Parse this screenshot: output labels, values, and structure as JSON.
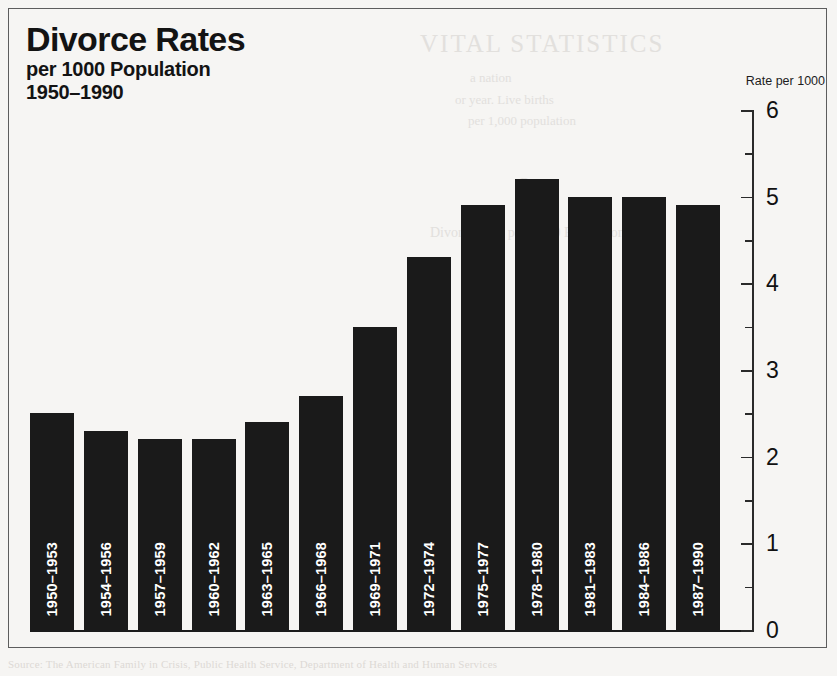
{
  "title": "Divorce Rates",
  "subtitle": "per 1000 Population",
  "period": "1950–1990",
  "axis_caption": "Rate per 1000",
  "bleed_through": {
    "note": "faint show-through text from the reverse side of the printed page",
    "line_title": "VITAL STATISTICS",
    "line1": "a nation",
    "line2": "or year. Live births",
    "line3": "per 1,000 population",
    "line4": "Rate",
    "line5": "Divorce Rate per 1,000 Population",
    "footer": "Source: The American Family in Crisis, Public Health Service, Department of Health and Human Services"
  },
  "chart_data": {
    "type": "bar",
    "title": "Divorce Rates per 1000 Population 1950–1990",
    "xlabel": "",
    "ylabel": "Rate per 1000",
    "ylim": [
      0,
      6
    ],
    "ytick_labels": [
      "0",
      "1",
      "2",
      "3",
      "4",
      "5",
      "6"
    ],
    "ytick_values": [
      0,
      1,
      2,
      3,
      4,
      5,
      6
    ],
    "yminor_values": [
      0.5,
      1.5,
      2.5,
      3.5,
      4.5,
      5.5
    ],
    "grid": false,
    "legend": "none",
    "bar_color": "#1a1a1a",
    "label_color": "#ffffff",
    "categories": [
      "1950–1953",
      "1954–1956",
      "1957–1959",
      "1960–1962",
      "1963–1965",
      "1966–1968",
      "1969–1971",
      "1972–1974",
      "1975–1977",
      "1978–1980",
      "1981–1983",
      "1984–1986",
      "1987–1990"
    ],
    "values": [
      2.5,
      2.3,
      2.2,
      2.2,
      2.4,
      2.7,
      3.5,
      4.3,
      4.9,
      5.2,
      5.0,
      5.0,
      4.9
    ]
  }
}
